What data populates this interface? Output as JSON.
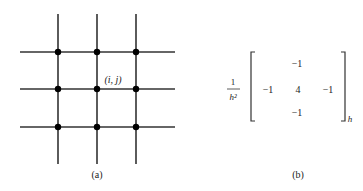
{
  "panel_a": {
    "label": "(a)",
    "grid": {
      "vertical_lines_x": [
        58,
        97,
        136
      ],
      "horizontal_lines_y": [
        52,
        89,
        127
      ],
      "line_color": "#333333",
      "node_color": "#000000"
    },
    "node_label": "(i, j)"
  },
  "panel_b": {
    "label": "(b)",
    "prefactor_numerator": "1",
    "prefactor_denominator": "h²",
    "stencil": {
      "top": "−1",
      "left": "−1",
      "center": "4",
      "right": "−1",
      "bottom": "−1"
    },
    "subscript": "h"
  }
}
